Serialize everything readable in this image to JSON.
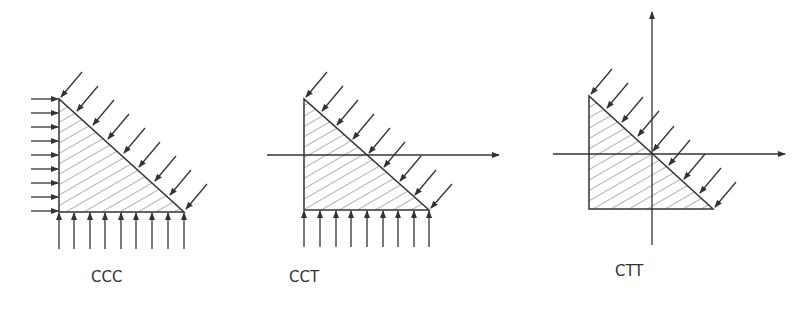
{
  "diagrams": [
    {
      "label": "CCC",
      "description": "compression on all three faces"
    },
    {
      "label": "CCT",
      "description": "compression-compression-tension"
    },
    {
      "label": "CTT",
      "description": "compression-tension-tension"
    }
  ],
  "colors": {
    "stroke": "#333333",
    "hatch": "#555555",
    "background": "#ffffff"
  }
}
